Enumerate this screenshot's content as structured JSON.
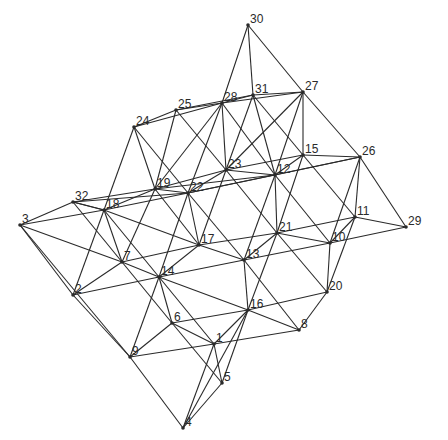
{
  "diagram": {
    "type": "space-truss",
    "colors": {
      "line": "#2a2a2a",
      "background": "#ffffff"
    },
    "nodes": [
      {
        "id": "1",
        "x": 214,
        "y": 344
      },
      {
        "id": "2",
        "x": 73,
        "y": 295
      },
      {
        "id": "3",
        "x": 20,
        "y": 225
      },
      {
        "id": "4",
        "x": 183,
        "y": 428
      },
      {
        "id": "5",
        "x": 222,
        "y": 383
      },
      {
        "id": "6",
        "x": 172,
        "y": 323
      },
      {
        "id": "7",
        "x": 122,
        "y": 262
      },
      {
        "id": "8",
        "x": 299,
        "y": 330
      },
      {
        "id": "9",
        "x": 130,
        "y": 357
      },
      {
        "id": "10",
        "x": 330,
        "y": 243
      },
      {
        "id": "11",
        "x": 355,
        "y": 217
      },
      {
        "id": "12",
        "x": 275,
        "y": 175
      },
      {
        "id": "13",
        "x": 244,
        "y": 260
      },
      {
        "id": "14",
        "x": 159,
        "y": 277
      },
      {
        "id": "15",
        "x": 303,
        "y": 155
      },
      {
        "id": "16",
        "x": 248,
        "y": 310
      },
      {
        "id": "17",
        "x": 199,
        "y": 245
      },
      {
        "id": "18",
        "x": 104,
        "y": 210
      },
      {
        "id": "19",
        "x": 155,
        "y": 189
      },
      {
        "id": "20",
        "x": 327,
        "y": 292
      },
      {
        "id": "21",
        "x": 277,
        "y": 233
      },
      {
        "id": "22",
        "x": 188,
        "y": 193
      },
      {
        "id": "23",
        "x": 226,
        "y": 170
      },
      {
        "id": "24",
        "x": 134,
        "y": 127
      },
      {
        "id": "25",
        "x": 176,
        "y": 110
      },
      {
        "id": "26",
        "x": 360,
        "y": 157
      },
      {
        "id": "27",
        "x": 303,
        "y": 92
      },
      {
        "id": "28",
        "x": 222,
        "y": 103
      },
      {
        "id": "29",
        "x": 406,
        "y": 227
      },
      {
        "id": "30",
        "x": 248,
        "y": 25
      },
      {
        "id": "31",
        "x": 253,
        "y": 95
      },
      {
        "id": "32",
        "x": 73,
        "y": 202
      }
    ],
    "edges": [
      [
        "3",
        "9"
      ],
      [
        "9",
        "4"
      ],
      [
        "4",
        "5"
      ],
      [
        "3",
        "18"
      ],
      [
        "3",
        "32"
      ],
      [
        "32",
        "18"
      ],
      [
        "3",
        "2"
      ],
      [
        "2",
        "9"
      ],
      [
        "2",
        "7"
      ],
      [
        "2",
        "14"
      ],
      [
        "2",
        "18"
      ],
      [
        "9",
        "6"
      ],
      [
        "9",
        "1"
      ],
      [
        "9",
        "14"
      ],
      [
        "4",
        "1"
      ],
      [
        "4",
        "16"
      ],
      [
        "5",
        "1"
      ],
      [
        "5",
        "6"
      ],
      [
        "5",
        "16"
      ],
      [
        "6",
        "1"
      ],
      [
        "6",
        "14"
      ],
      [
        "6",
        "16"
      ],
      [
        "6",
        "7"
      ],
      [
        "1",
        "8"
      ],
      [
        "1",
        "16"
      ],
      [
        "1",
        "14"
      ],
      [
        "8",
        "16"
      ],
      [
        "8",
        "20"
      ],
      [
        "8",
        "13"
      ],
      [
        "16",
        "20"
      ],
      [
        "16",
        "13"
      ],
      [
        "16",
        "14"
      ],
      [
        "16",
        "21"
      ],
      [
        "20",
        "10"
      ],
      [
        "20",
        "11"
      ],
      [
        "20",
        "21"
      ],
      [
        "14",
        "7"
      ],
      [
        "14",
        "17"
      ],
      [
        "14",
        "13"
      ],
      [
        "14",
        "18"
      ],
      [
        "14",
        "22"
      ],
      [
        "7",
        "18"
      ],
      [
        "7",
        "17"
      ],
      [
        "7",
        "19"
      ],
      [
        "7",
        "32"
      ],
      [
        "17",
        "13"
      ],
      [
        "17",
        "22"
      ],
      [
        "17",
        "21"
      ],
      [
        "17",
        "18"
      ],
      [
        "17",
        "23"
      ],
      [
        "17",
        "19"
      ],
      [
        "13",
        "21"
      ],
      [
        "13",
        "10"
      ],
      [
        "13",
        "22"
      ],
      [
        "13",
        "12"
      ],
      [
        "21",
        "10"
      ],
      [
        "21",
        "11"
      ],
      [
        "21",
        "12"
      ],
      [
        "21",
        "23"
      ],
      [
        "21",
        "15"
      ],
      [
        "10",
        "11"
      ],
      [
        "10",
        "29"
      ],
      [
        "10",
        "26"
      ],
      [
        "10",
        "12"
      ],
      [
        "11",
        "29"
      ],
      [
        "11",
        "26"
      ],
      [
        "11",
        "15"
      ],
      [
        "18",
        "19"
      ],
      [
        "18",
        "32"
      ],
      [
        "18",
        "24"
      ],
      [
        "18",
        "22"
      ],
      [
        "19",
        "22"
      ],
      [
        "19",
        "24"
      ],
      [
        "19",
        "25"
      ],
      [
        "19",
        "28"
      ],
      [
        "19",
        "12"
      ],
      [
        "19",
        "23"
      ],
      [
        "22",
        "23"
      ],
      [
        "22",
        "24"
      ],
      [
        "22",
        "28"
      ],
      [
        "22",
        "12"
      ],
      [
        "22",
        "26"
      ],
      [
        "23",
        "12"
      ],
      [
        "23",
        "28"
      ],
      [
        "23",
        "25"
      ],
      [
        "23",
        "31"
      ],
      [
        "23",
        "15"
      ],
      [
        "23",
        "27"
      ],
      [
        "12",
        "15"
      ],
      [
        "12",
        "26"
      ],
      [
        "12",
        "31"
      ],
      [
        "12",
        "27"
      ],
      [
        "12",
        "28"
      ],
      [
        "15",
        "26"
      ],
      [
        "15",
        "27"
      ],
      [
        "15",
        "31"
      ],
      [
        "26",
        "29"
      ],
      [
        "26",
        "27"
      ],
      [
        "24",
        "25"
      ],
      [
        "24",
        "28"
      ],
      [
        "25",
        "28"
      ],
      [
        "25",
        "31"
      ],
      [
        "28",
        "31"
      ],
      [
        "31",
        "27"
      ],
      [
        "28",
        "27"
      ],
      [
        "30",
        "28"
      ],
      [
        "30",
        "31"
      ],
      [
        "30",
        "27"
      ],
      [
        "32",
        "19"
      ],
      [
        "32",
        "22"
      ],
      [
        "3",
        "7"
      ]
    ]
  }
}
